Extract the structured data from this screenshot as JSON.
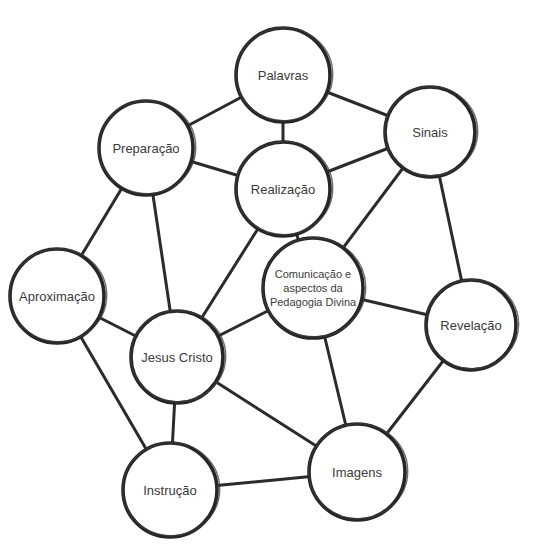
{
  "diagram": {
    "type": "concept-network",
    "colors": {
      "stroke": "#262626",
      "text": "#3a3a3a",
      "background": "#ffffff"
    },
    "nodes": [
      {
        "id": "palavras",
        "label": "Palavras",
        "x": 283,
        "y": 75,
        "r": 47
      },
      {
        "id": "sinais",
        "label": "Sinais",
        "x": 430,
        "y": 132,
        "r": 45
      },
      {
        "id": "preparacao",
        "label": "Preparação",
        "x": 146,
        "y": 148,
        "r": 47
      },
      {
        "id": "realizacao",
        "label": "Realização",
        "x": 283,
        "y": 189,
        "r": 47
      },
      {
        "id": "comunicacao",
        "label": "Comunicação e\naspectos da\nPedagogia Divina",
        "x": 313,
        "y": 288,
        "r": 50
      },
      {
        "id": "aproximacao",
        "label": "Aproximação",
        "x": 57,
        "y": 296,
        "r": 47
      },
      {
        "id": "revelacao",
        "label": "Revelação",
        "x": 471,
        "y": 325,
        "r": 45
      },
      {
        "id": "jesus_cristo",
        "label": "Jesus Cristo",
        "x": 177,
        "y": 357,
        "r": 46
      },
      {
        "id": "instrucao",
        "label": "Instrução",
        "x": 170,
        "y": 490,
        "r": 47
      },
      {
        "id": "imagens",
        "label": "Imagens",
        "x": 357,
        "y": 472,
        "r": 48
      }
    ],
    "edges": [
      [
        "palavras",
        "preparacao"
      ],
      [
        "palavras",
        "sinais"
      ],
      [
        "palavras",
        "realizacao"
      ],
      [
        "preparacao",
        "realizacao"
      ],
      [
        "preparacao",
        "aproximacao"
      ],
      [
        "preparacao",
        "jesus_cristo"
      ],
      [
        "sinais",
        "realizacao"
      ],
      [
        "sinais",
        "comunicacao"
      ],
      [
        "sinais",
        "revelacao"
      ],
      [
        "realizacao",
        "comunicacao"
      ],
      [
        "realizacao",
        "jesus_cristo"
      ],
      [
        "comunicacao",
        "jesus_cristo"
      ],
      [
        "comunicacao",
        "revelacao"
      ],
      [
        "comunicacao",
        "imagens"
      ],
      [
        "aproximacao",
        "jesus_cristo"
      ],
      [
        "aproximacao",
        "instrucao"
      ],
      [
        "jesus_cristo",
        "instrucao"
      ],
      [
        "jesus_cristo",
        "imagens"
      ],
      [
        "instrucao",
        "imagens"
      ],
      [
        "revelacao",
        "imagens"
      ]
    ]
  }
}
